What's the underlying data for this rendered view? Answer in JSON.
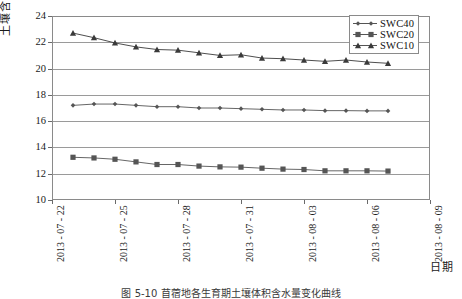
{
  "chart_data": {
    "type": "line",
    "title": "",
    "xlabel": "日期",
    "ylabel": "土壤含水量/%",
    "ylim": [
      10,
      24
    ],
    "ytick_step": 2,
    "yticks": [
      10,
      12,
      14,
      16,
      18,
      20,
      22,
      24
    ],
    "grid": "horizontal",
    "legend_position": "top-right",
    "xticks": [
      "2013 - 07 - 22",
      "2013 - 07 - 25",
      "2013 - 07 - 28",
      "2013 - 07 - 31",
      "2013 - 08 - 03",
      "2013 - 08 - 06",
      "2013 - 08 - 09"
    ],
    "x": [
      "2013-07-23",
      "2013-07-24",
      "2013-07-25",
      "2013-07-26",
      "2013-07-27",
      "2013-07-28",
      "2013-07-29",
      "2013-07-30",
      "2013-07-31",
      "2013-08-01",
      "2013-08-02",
      "2013-08-03",
      "2013-08-04",
      "2013-08-05",
      "2013-08-06",
      "2013-08-07"
    ],
    "series": [
      {
        "name": "SWC40",
        "marker": "diamond",
        "color": "#555555",
        "values": [
          17.2,
          17.3,
          17.3,
          17.2,
          17.1,
          17.1,
          17.0,
          17.0,
          16.95,
          16.9,
          16.85,
          16.85,
          16.8,
          16.8,
          16.78,
          16.78
        ]
      },
      {
        "name": "SWC20",
        "marker": "square",
        "color": "#555555",
        "values": [
          13.25,
          13.2,
          13.1,
          12.9,
          12.7,
          12.7,
          12.58,
          12.52,
          12.5,
          12.42,
          12.35,
          12.32,
          12.22,
          12.22,
          12.22,
          12.2
        ]
      },
      {
        "name": "SWC10",
        "marker": "triangle",
        "color": "#3a3a3a",
        "values": [
          22.7,
          22.35,
          21.95,
          21.65,
          21.45,
          21.4,
          21.2,
          21.0,
          21.05,
          20.8,
          20.75,
          20.65,
          20.55,
          20.65,
          20.5,
          20.4
        ]
      }
    ]
  },
  "legend": {
    "entries": [
      {
        "label": "SWC40"
      },
      {
        "label": "SWC20"
      },
      {
        "label": "SWC10"
      }
    ]
  },
  "axes": {
    "y_title": "土壤含水量/%",
    "x_title": "日期"
  },
  "caption": "图 5-10  苜蓿地各生育期土壤体积含水量变化曲线"
}
